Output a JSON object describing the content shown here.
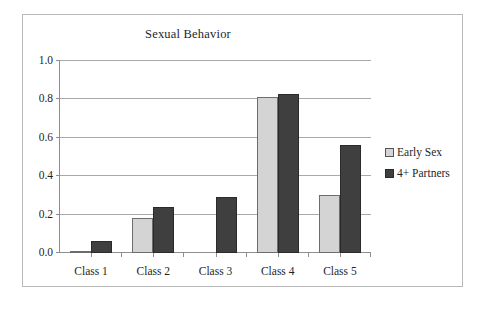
{
  "chart_data": {
    "type": "bar",
    "title": "Sexual Behavior",
    "xlabel": "",
    "ylabel": "",
    "categories": [
      "Class 1",
      "Class 2",
      "Class 3",
      "Class 4",
      "Class 5"
    ],
    "series": [
      {
        "name": "Early Sex",
        "color": "#d4d4d4",
        "values": [
          0.01,
          0.18,
          0.0,
          0.81,
          0.3
        ]
      },
      {
        "name": "4+ Partners",
        "color": "#3f3f3f",
        "values": [
          0.06,
          0.24,
          0.29,
          0.83,
          0.56
        ]
      }
    ],
    "ylim": [
      0.0,
      1.0
    ],
    "yticks": [
      "0.0",
      "0.2",
      "0.4",
      "0.6",
      "0.8",
      "1.0"
    ],
    "ytick_values": [
      0.0,
      0.2,
      0.4,
      0.6,
      0.8,
      1.0
    ],
    "grid": true,
    "legend_position": "right"
  },
  "legend": {
    "items": [
      {
        "label": "Early Sex"
      },
      {
        "label": "4+ Partners"
      }
    ]
  }
}
